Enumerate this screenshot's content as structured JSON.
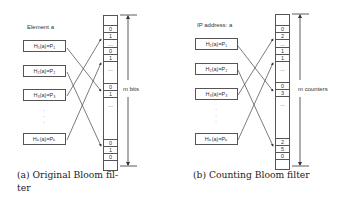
{
  "panels": [
    {
      "id": "a",
      "input_label": "Element a",
      "hash_functions": [
        {
          "label": "H₁(a)=P₁"
        },
        {
          "label": "H₂(a)=P₂"
        },
        {
          "label": "H₃(a)=P₃"
        },
        {
          "label": "Hₖ(a)=Pₖ"
        }
      ],
      "ellipsis": "·\n·\n·",
      "array_cells": [
        "",
        "0",
        "1",
        "...",
        "0",
        "1",
        "...",
        "0",
        "1",
        "...",
        "0",
        "1",
        "0",
        ""
      ],
      "size_label": "m bits",
      "caption_line1": "(a) Original Bloom fil-",
      "caption_line2": "ter"
    },
    {
      "id": "b",
      "input_label": "IP address: a",
      "hash_functions": [
        {
          "label": "H₁(a)=P₁"
        },
        {
          "label": "H₂(a)=P₂"
        },
        {
          "label": "H₃(a)=P₃"
        },
        {
          "label": "Hₖ(a)=Pₖ"
        }
      ],
      "ellipsis": "·\n·\n·",
      "array_cells": [
        "",
        "0",
        "2",
        "...",
        "1",
        "1",
        "...",
        "0",
        "3",
        "...",
        "2",
        "5",
        "0",
        ""
      ],
      "size_label": "m counters",
      "caption_line1": "(b) Counting Bloom filter",
      "caption_line2": ""
    }
  ]
}
